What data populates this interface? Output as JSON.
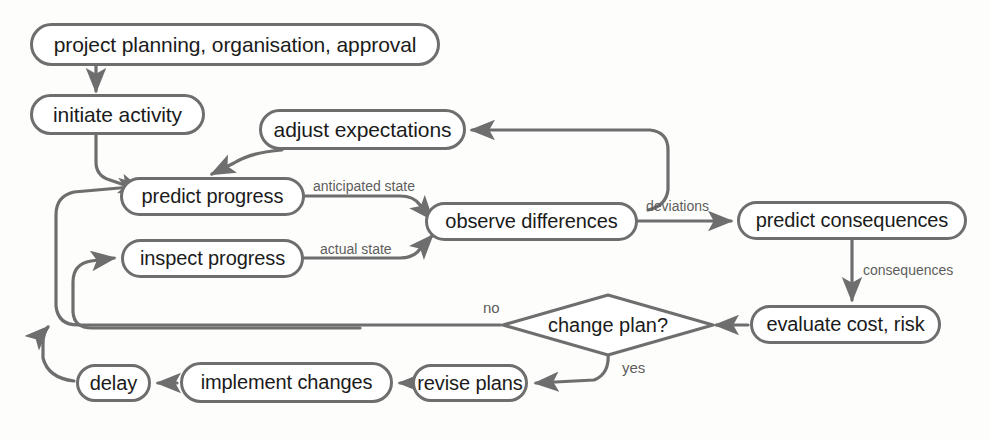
{
  "diagram": {
    "stroke_color": "#6e6e6e",
    "text_color": "#1b1b1b",
    "label_color": "#5d5d5d",
    "background": "#fdfdfc",
    "nodes": [
      {
        "id": "project-planning",
        "label": "project planning, organisation, approval",
        "shape": "rounded-rect"
      },
      {
        "id": "initiate-activity",
        "label": "initiate activity",
        "shape": "rounded-rect"
      },
      {
        "id": "adjust-expectations",
        "label": "adjust expectations",
        "shape": "rounded-rect"
      },
      {
        "id": "predict-progress",
        "label": "predict progress",
        "shape": "rounded-rect"
      },
      {
        "id": "inspect-progress",
        "label": "inspect progress",
        "shape": "rounded-rect"
      },
      {
        "id": "observe-differences",
        "label": "observe differences",
        "shape": "rounded-rect"
      },
      {
        "id": "predict-consequences",
        "label": "predict consequences",
        "shape": "rounded-rect"
      },
      {
        "id": "evaluate-cost-risk",
        "label": "evaluate cost, risk",
        "shape": "rounded-rect"
      },
      {
        "id": "change-plan",
        "label": "change plan?",
        "shape": "diamond"
      },
      {
        "id": "revise-plans",
        "label": "revise plans",
        "shape": "rounded-rect"
      },
      {
        "id": "implement-changes",
        "label": "implement changes",
        "shape": "rounded-rect"
      },
      {
        "id": "delay",
        "label": "delay",
        "shape": "rounded-rect"
      }
    ],
    "edge_labels": [
      {
        "id": "anticipated-state",
        "label": "anticipated state"
      },
      {
        "id": "actual-state",
        "label": "actual state"
      },
      {
        "id": "deviations",
        "label": "deviations"
      },
      {
        "id": "consequences",
        "label": "consequences"
      },
      {
        "id": "no",
        "label": "no"
      },
      {
        "id": "yes",
        "label": "yes"
      }
    ],
    "edges": [
      {
        "from": "project-planning",
        "to": "initiate-activity",
        "label": ""
      },
      {
        "from": "initiate-activity",
        "to": "predict-progress",
        "label": ""
      },
      {
        "from": "adjust-expectations",
        "to": "predict-progress",
        "label": ""
      },
      {
        "from": "predict-progress",
        "to": "observe-differences",
        "label": "anticipated state"
      },
      {
        "from": "inspect-progress",
        "to": "observe-differences",
        "label": "actual state"
      },
      {
        "from": "observe-differences",
        "to": "adjust-expectations",
        "label": ""
      },
      {
        "from": "observe-differences",
        "to": "predict-consequences",
        "label": "deviations"
      },
      {
        "from": "predict-consequences",
        "to": "evaluate-cost-risk",
        "label": "consequences"
      },
      {
        "from": "evaluate-cost-risk",
        "to": "change-plan",
        "label": ""
      },
      {
        "from": "change-plan",
        "to": "inspect-progress",
        "label": "no"
      },
      {
        "from": "change-plan",
        "to": "revise-plans",
        "label": "yes"
      },
      {
        "from": "revise-plans",
        "to": "implement-changes",
        "label": ""
      },
      {
        "from": "implement-changes",
        "to": "delay",
        "label": ""
      },
      {
        "from": "delay",
        "to": "predict-progress",
        "label": ""
      }
    ]
  }
}
